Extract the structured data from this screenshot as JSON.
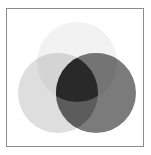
{
  "figure": {
    "type": "venn-diagram",
    "title": "",
    "canvas": {
      "width": 151,
      "height": 155,
      "background": "#ffffff"
    },
    "frame": {
      "visible": true,
      "x": 6,
      "y": 8,
      "width": 138,
      "height": 139,
      "stroke": "#8c8c8c",
      "stroke_width": 1,
      "fill": "#ffffff"
    },
    "blend_mode": "multiply",
    "set_count": 3,
    "sets": [
      {
        "id": "set-top",
        "label": "",
        "cx": 77,
        "cy": 62,
        "r": 40,
        "fill": "#f2f2f2",
        "opacity": 1,
        "tone": "very-light-gray"
      },
      {
        "id": "set-left",
        "label": "",
        "cx": 58,
        "cy": 93,
        "r": 40,
        "fill": "#dedede",
        "opacity": 1,
        "tone": "light-gray"
      },
      {
        "id": "set-right",
        "label": "",
        "cx": 96,
        "cy": 93,
        "r": 40,
        "fill": "#7b7b7b",
        "opacity": 1,
        "tone": "medium-dark-gray"
      }
    ],
    "regions": [
      {
        "id": "top-only",
        "members": [
          "set-top"
        ],
        "fill": "#f2f2f2",
        "label": ""
      },
      {
        "id": "left-only",
        "members": [
          "set-left"
        ],
        "fill": "#dedede",
        "label": ""
      },
      {
        "id": "right-only",
        "members": [
          "set-right"
        ],
        "fill": "#7b7b7b",
        "label": ""
      },
      {
        "id": "top-left",
        "members": [
          "set-top",
          "set-left"
        ],
        "fill": "#d4d4d4",
        "label": ""
      },
      {
        "id": "top-right",
        "members": [
          "set-top",
          "set-right"
        ],
        "fill": "#747474",
        "label": ""
      },
      {
        "id": "left-right",
        "members": [
          "set-left",
          "set-right"
        ],
        "fill": "#5c5c5c",
        "label": ""
      },
      {
        "id": "all-three",
        "members": [
          "set-top",
          "set-left",
          "set-right"
        ],
        "fill": "#292929",
        "label": ""
      }
    ],
    "legend": {
      "visible": false,
      "entries": []
    },
    "axis_labels": [],
    "annotations": []
  }
}
